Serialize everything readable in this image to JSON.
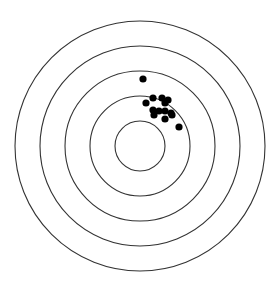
{
  "figure": {
    "type": "target-diagram",
    "width": 275,
    "height": 282,
    "background": "#ffffff"
  },
  "target": {
    "center": {
      "x": 140,
      "y": 146
    },
    "ring_color": "#333333",
    "ring_stroke_width": 1.1,
    "rings": [
      {
        "radius": 125
      },
      {
        "radius": 100
      },
      {
        "radius": 75
      },
      {
        "radius": 50
      },
      {
        "radius": 25
      }
    ]
  },
  "shots": {
    "color": "#000000",
    "radius": 3.6,
    "points": [
      {
        "x": 143,
        "y": 79
      },
      {
        "x": 153,
        "y": 98
      },
      {
        "x": 162,
        "y": 98
      },
      {
        "x": 168,
        "y": 100
      },
      {
        "x": 165,
        "y": 103
      },
      {
        "x": 146,
        "y": 103
      },
      {
        "x": 153,
        "y": 110
      },
      {
        "x": 159,
        "y": 111
      },
      {
        "x": 165,
        "y": 111
      },
      {
        "x": 171,
        "y": 113
      },
      {
        "x": 172,
        "y": 115
      },
      {
        "x": 154,
        "y": 115
      },
      {
        "x": 165,
        "y": 119
      },
      {
        "x": 179,
        "y": 127
      }
    ]
  }
}
